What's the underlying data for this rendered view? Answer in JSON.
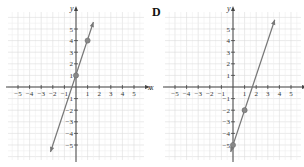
{
  "chart_data": [
    {
      "type": "line",
      "panel_label": "",
      "xlabel": "x",
      "ylabel": "y",
      "xlim": [
        -5,
        5
      ],
      "ylim": [
        -5,
        5
      ],
      "grid": true,
      "x_ticks": [
        "-5",
        "-4",
        "-3",
        "-2",
        "-1",
        "1",
        "2",
        "3",
        "4",
        "5"
      ],
      "y_ticks": [
        "5",
        "4",
        "3",
        "2",
        "1",
        "-1",
        "-2",
        "-3",
        "-4",
        "-5"
      ],
      "line": {
        "slope": 3,
        "intercept": 1,
        "equation": "y = 3x + 1",
        "from": [
          -2.2,
          -5.6
        ],
        "to": [
          1.5,
          5.6
        ],
        "arrows": "both"
      },
      "points": [
        {
          "x": 0,
          "y": 1
        },
        {
          "x": 1,
          "y": 4
        }
      ],
      "colors": {
        "line": "#777777",
        "point": "#888888",
        "grid": "#e2e2e2",
        "axis": "#444444"
      }
    },
    {
      "type": "line",
      "panel_label": "D",
      "xlabel": "x",
      "ylabel": "y",
      "xlim": [
        -5,
        5
      ],
      "ylim": [
        -5,
        5
      ],
      "grid": true,
      "x_ticks": [
        "-5",
        "-4",
        "-3",
        "-2",
        "-1",
        "1",
        "2",
        "3",
        "4",
        "5"
      ],
      "y_ticks": [
        "5",
        "4",
        "3",
        "2",
        "1",
        "-1",
        "-2",
        "-3",
        "-4",
        "-5"
      ],
      "line": {
        "slope": 3,
        "intercept": -5,
        "equation": "y = 3x - 5",
        "from": [
          -0.2,
          -5.6
        ],
        "to": [
          3.6,
          5.8
        ],
        "arrows": "both"
      },
      "points": [
        {
          "x": 0,
          "y": -5
        },
        {
          "x": 1,
          "y": -2
        }
      ],
      "colors": {
        "line": "#777777",
        "point": "#888888",
        "grid": "#e2e2e2",
        "axis": "#444444"
      }
    }
  ]
}
